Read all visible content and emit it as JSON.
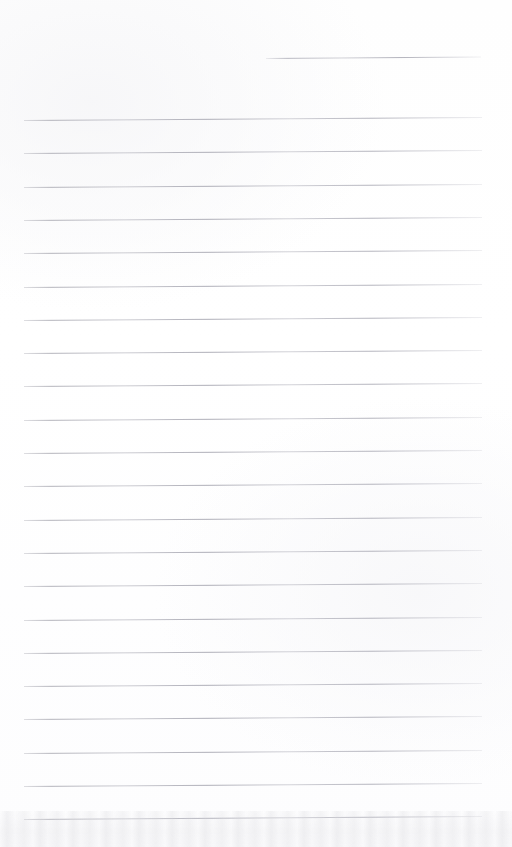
{
  "document": {
    "kind": "scanned-lined-notebook-page",
    "title": "Blank ruled notebook page",
    "page_width": 512,
    "page_height": 847,
    "background_color": "#ffffff",
    "rule_color": "#b4b4bc",
    "text_content": "",
    "handwriting_present": "none",
    "body_text": ""
  },
  "ruling": {
    "line_count_total": 23,
    "full_line_count": 22,
    "partial_line_count": 1,
    "line_spacing_px": 33.3,
    "line_thickness_px": 1,
    "left_margin_px": 24,
    "right_margin_px": 482,
    "slant_degrees": -0.38,
    "first_full_line_y": 120,
    "last_full_line_y": 819
  },
  "lines": [
    {
      "id": "rule-0",
      "y": 58,
      "x_start": 266,
      "x_end": 481,
      "type": "partial"
    },
    {
      "id": "rule-1",
      "y": 120,
      "x_start": 24,
      "x_end": 482,
      "type": "full"
    },
    {
      "id": "rule-2",
      "y": 153.3,
      "x_start": 24,
      "x_end": 482,
      "type": "full"
    },
    {
      "id": "rule-3",
      "y": 186.6,
      "x_start": 24,
      "x_end": 482,
      "type": "full"
    },
    {
      "id": "rule-4",
      "y": 219.9,
      "x_start": 24,
      "x_end": 482,
      "type": "full"
    },
    {
      "id": "rule-5",
      "y": 253.2,
      "x_start": 24,
      "x_end": 482,
      "type": "full"
    },
    {
      "id": "rule-6",
      "y": 286.5,
      "x_start": 24,
      "x_end": 482,
      "type": "full"
    },
    {
      "id": "rule-7",
      "y": 319.8,
      "x_start": 24,
      "x_end": 482,
      "type": "full"
    },
    {
      "id": "rule-8",
      "y": 353.1,
      "x_start": 24,
      "x_end": 482,
      "type": "full"
    },
    {
      "id": "rule-9",
      "y": 386.4,
      "x_start": 24,
      "x_end": 482,
      "type": "full"
    },
    {
      "id": "rule-10",
      "y": 419.7,
      "x_start": 24,
      "x_end": 482,
      "type": "full"
    },
    {
      "id": "rule-11",
      "y": 453.0,
      "x_start": 24,
      "x_end": 482,
      "type": "full"
    },
    {
      "id": "rule-12",
      "y": 486.3,
      "x_start": 24,
      "x_end": 482,
      "type": "full"
    },
    {
      "id": "rule-13",
      "y": 519.6,
      "x_start": 24,
      "x_end": 482,
      "type": "full"
    },
    {
      "id": "rule-14",
      "y": 552.9,
      "x_start": 24,
      "x_end": 482,
      "type": "full"
    },
    {
      "id": "rule-15",
      "y": 586.2,
      "x_start": 24,
      "x_end": 482,
      "type": "full"
    },
    {
      "id": "rule-16",
      "y": 619.5,
      "x_start": 24,
      "x_end": 482,
      "type": "full"
    },
    {
      "id": "rule-17",
      "y": 652.8,
      "x_start": 24,
      "x_end": 482,
      "type": "full"
    },
    {
      "id": "rule-18",
      "y": 686.1,
      "x_start": 24,
      "x_end": 482,
      "type": "full"
    },
    {
      "id": "rule-19",
      "y": 719.4,
      "x_start": 24,
      "x_end": 482,
      "type": "full"
    },
    {
      "id": "rule-20",
      "y": 752.7,
      "x_start": 24,
      "x_end": 482,
      "type": "full"
    },
    {
      "id": "rule-21",
      "y": 786.0,
      "x_start": 24,
      "x_end": 482,
      "type": "full"
    },
    {
      "id": "rule-22",
      "y": 819.0,
      "x_start": 24,
      "x_end": 482,
      "type": "full"
    }
  ],
  "artifacts": {
    "bottom_shadow_band": {
      "present": true,
      "y_start": 811,
      "height": 36,
      "color": "#d6d6da"
    }
  }
}
